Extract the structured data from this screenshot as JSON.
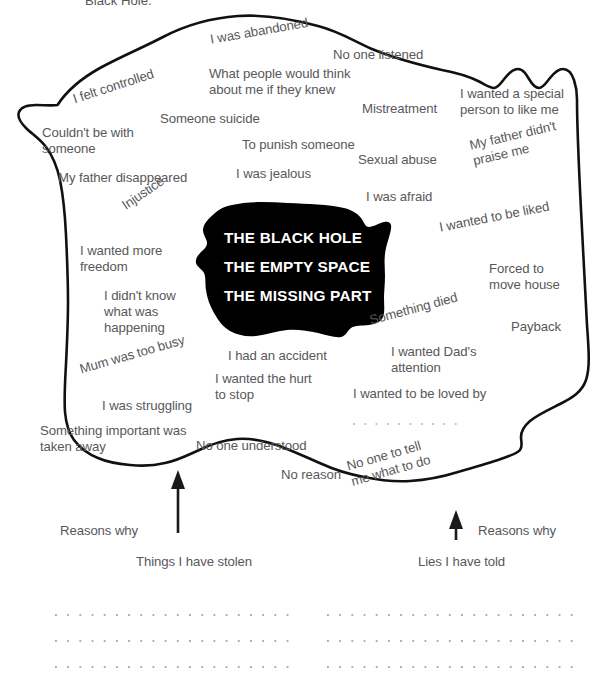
{
  "page": {
    "top_cut_caption": "Black Hole."
  },
  "blob": {
    "line1": "THE BLACK HOLE",
    "line2": "THE EMPTY SPACE",
    "line3": "THE MISSING PART",
    "fill_color": "#000000"
  },
  "outline": {
    "stroke_color": "#111111",
    "fill_color": "#ffffff"
  },
  "reasons": [
    {
      "text": "I was abandoned",
      "x": 209,
      "y": 32,
      "rot": -10,
      "w": 120
    },
    {
      "text": "No one listened",
      "x": 333,
      "y": 47,
      "rot": 0,
      "w": 110
    },
    {
      "text": "What people would think\nabout me if they knew",
      "x": 209,
      "y": 66,
      "rot": 0,
      "w": 165
    },
    {
      "text": "I felt controlled",
      "x": 71,
      "y": 92,
      "rot": -18,
      "w": 105
    },
    {
      "text": "Mistreatment",
      "x": 362,
      "y": 101,
      "rot": 0,
      "w": 95
    },
    {
      "text": "I wanted a special\nperson to like me",
      "x": 460,
      "y": 86,
      "rot": 0,
      "w": 135
    },
    {
      "text": "Someone suicide",
      "x": 160,
      "y": 111,
      "rot": 0,
      "w": 115
    },
    {
      "text": "Couldn't be with\nsomeone",
      "x": 42,
      "y": 125,
      "rot": 0,
      "w": 120
    },
    {
      "text": "To punish someone",
      "x": 242,
      "y": 137,
      "rot": 0,
      "w": 130
    },
    {
      "text": "Sexual abuse",
      "x": 358,
      "y": 152,
      "rot": 0,
      "w": 95
    },
    {
      "text": "My father didn't\npraise me",
      "x": 468,
      "y": 138,
      "rot": -13,
      "w": 115
    },
    {
      "text": "My father disappeared",
      "x": 58,
      "y": 170,
      "rot": 0,
      "w": 155
    },
    {
      "text": "I was jealous",
      "x": 236,
      "y": 166,
      "rot": 0,
      "w": 90
    },
    {
      "text": "I was afraid",
      "x": 366,
      "y": 189,
      "rot": 0,
      "w": 80
    },
    {
      "text": "Injustice",
      "x": 119,
      "y": 200,
      "rot": -34,
      "w": 62
    },
    {
      "text": "I wanted to be liked",
      "x": 438,
      "y": 220,
      "rot": -11,
      "w": 135
    },
    {
      "text": "I wanted more\nfreedom",
      "x": 80,
      "y": 243,
      "rot": 0,
      "w": 105
    },
    {
      "text": "Forced to\nmove house",
      "x": 489,
      "y": 261,
      "rot": 0,
      "w": 100
    },
    {
      "text": "I didn't know\nwhat was\nhappening",
      "x": 104,
      "y": 288,
      "rot": 0,
      "w": 100
    },
    {
      "text": "Something died",
      "x": 368,
      "y": 313,
      "rot": -15,
      "w": 108
    },
    {
      "text": "Payback",
      "x": 511,
      "y": 319,
      "rot": 0,
      "w": 65
    },
    {
      "text": "Mum was too busy",
      "x": 78,
      "y": 362,
      "rot": -16,
      "w": 132
    },
    {
      "text": "I had an accident",
      "x": 228,
      "y": 348,
      "rot": 0,
      "w": 115
    },
    {
      "text": "I wanted Dad's\nattention",
      "x": 391,
      "y": 344,
      "rot": 0,
      "w": 105
    },
    {
      "text": "I wanted the hurt\nto stop",
      "x": 215,
      "y": 371,
      "rot": 0,
      "w": 120
    },
    {
      "text": "I was struggling",
      "x": 102,
      "y": 398,
      "rot": 0,
      "w": 105
    },
    {
      "text": "I wanted to be loved by",
      "x": 353,
      "y": 386,
      "rot": 0,
      "w": 160
    },
    {
      "text": "Something important was\ntaken away",
      "x": 40,
      "y": 423,
      "rot": 0,
      "w": 170
    },
    {
      "text": "No one understood",
      "x": 196,
      "y": 438,
      "rot": 0,
      "w": 140
    },
    {
      "text": "No reason",
      "x": 281,
      "y": 467,
      "rot": 0,
      "w": 75
    },
    {
      "text": "No one to tell\nme what to do",
      "x": 345,
      "y": 459,
      "rot": -16,
      "w": 105
    }
  ],
  "dotted_lines_inside": [
    {
      "x": 353,
      "y": 423,
      "w": 112
    }
  ],
  "annotations": {
    "left_reasons_label": "Reasons why",
    "right_reasons_label": "Reasons why",
    "left_arrow_caption": "Things I have stolen",
    "right_arrow_caption": "Lies I have told"
  },
  "writing_lines": {
    "left_column": [
      {
        "x": 55,
        "y": 614,
        "w": 236
      },
      {
        "x": 55,
        "y": 640,
        "w": 236
      },
      {
        "x": 55,
        "y": 666,
        "w": 236
      }
    ],
    "right_column": [
      {
        "x": 327,
        "y": 614,
        "w": 248
      },
      {
        "x": 327,
        "y": 640,
        "w": 248
      },
      {
        "x": 327,
        "y": 666,
        "w": 248
      }
    ]
  }
}
